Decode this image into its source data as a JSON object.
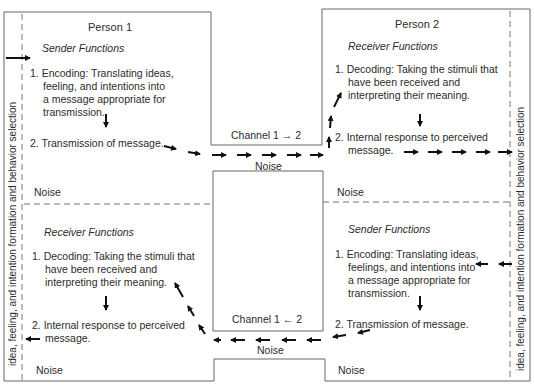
{
  "person1": {
    "title": "Person 1",
    "sender": {
      "heading": "Sender Functions",
      "step1": [
        "1. Encoding: Translating ideas,",
        "feeling, and intentions into",
        "a message appropriate for",
        "transmission."
      ],
      "step2": "2. Transmission of message."
    },
    "receiver": {
      "heading": "Receiver Functions",
      "step1": [
        "1. Decoding: Taking the stimuli that",
        "have been received and",
        "interpreting their meaning."
      ],
      "step2": [
        "2. Internal response to perceived",
        "message."
      ]
    },
    "noise_top": "Noise",
    "noise_bottom": "Noise",
    "side_label": "idea, feeling, and intention formation and behavior selection"
  },
  "person2": {
    "title": "Person 2",
    "receiver": {
      "heading": "Receiver Functions",
      "step1": [
        "1. Decoding: Taking the stimuli that",
        "have been received and",
        "interpreting their meaning."
      ],
      "step2": [
        "2. Internal response to perceived",
        "message."
      ]
    },
    "sender": {
      "heading": "Sender Functions",
      "step1": [
        "1. Encoding: Translating ideas,",
        "feelings, and intentions into",
        "a message appropriate for",
        "transmission."
      ],
      "step2": "2. Transmission of message."
    },
    "noise_top": "Noise",
    "noise_bottom": "Noise",
    "side_label": "idea, feeling, and intention formation and behavior selection"
  },
  "channel_top": {
    "label": "Channel 1 → 2",
    "noise": "Noise"
  },
  "channel_bottom": {
    "label": "Channel 1 ← 2",
    "noise": "Noise"
  },
  "colors": {
    "line": "#555555",
    "arrow": "#111111",
    "text": "#2b2b2b"
  }
}
